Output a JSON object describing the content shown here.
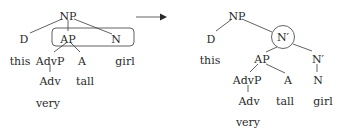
{
  "diagram": {
    "type": "syntax-tree-transformation",
    "colors": {
      "text": "#2a2a2a",
      "line": "#3a3a3a",
      "background": "#ffffff"
    },
    "left_tree": {
      "nodes": {
        "np": "NP",
        "d": "D",
        "ap": "AP",
        "n": "N",
        "this": "this",
        "advp": "AdvP",
        "a": "A",
        "girl": "girl",
        "adv": "Adv",
        "tall": "tall",
        "very": "very"
      },
      "highlight": {
        "shape": "rounded-rectangle",
        "encloses": [
          "AP",
          "N"
        ]
      }
    },
    "arrow": {
      "direction": "right"
    },
    "right_tree": {
      "nodes": {
        "np": "NP",
        "d": "D",
        "nbar_top": "N′",
        "this": "this",
        "ap": "AP",
        "nbar": "N′",
        "advp": "AdvP",
        "a": "A",
        "n": "N",
        "adv": "Adv",
        "tall": "tall",
        "girl": "girl",
        "very": "very"
      },
      "highlight": {
        "shape": "circle",
        "encloses": [
          "N′"
        ]
      }
    }
  }
}
